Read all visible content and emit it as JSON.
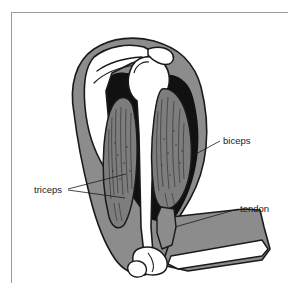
{
  "figure": {
    "kind": "anatomical-diagram",
    "frame_border_color": "#9a9a9a",
    "background_color": "#ffffff"
  },
  "palette": {
    "outline": "#1a1a1a",
    "skin_gray": "#8c8c8c",
    "fascia_black": "#111111",
    "muscle_gray": "#7d7d7d",
    "bone_white": "#ffffff",
    "striation": "#2a2a2a",
    "label_text": "#1a1a1a"
  },
  "labels": [
    {
      "id": "biceps",
      "text": "biceps",
      "text_x": 211,
      "text_y": 131,
      "anchor": "start",
      "leaders": [
        {
          "x1": 208,
          "y1": 128,
          "x2": 180,
          "y2": 143
        }
      ]
    },
    {
      "id": "triceps",
      "text": "triceps",
      "text_x": 22,
      "text_y": 180,
      "anchor": "start",
      "leaders": [
        {
          "x1": 56,
          "y1": 176,
          "x2": 114,
          "y2": 161
        },
        {
          "x1": 56,
          "y1": 177,
          "x2": 113,
          "y2": 185
        }
      ]
    },
    {
      "id": "tendon",
      "text": "tendon",
      "text_x": 228,
      "text_y": 199,
      "anchor": "start",
      "leaders": [
        {
          "x1": 226,
          "y1": 196,
          "x2": 163,
          "y2": 214
        }
      ]
    }
  ],
  "parts": [
    {
      "id": "skin-outline",
      "name": "arm skin and subcutaneous layer",
      "fill": "#8c8c8c"
    },
    {
      "id": "scapula",
      "name": "scapula",
      "fill": "#ffffff"
    },
    {
      "id": "humerus",
      "name": "humerus",
      "fill": "#ffffff"
    },
    {
      "id": "biceps-belly",
      "name": "biceps muscle belly",
      "fill": "#7d7d7d"
    },
    {
      "id": "triceps-belly",
      "name": "triceps muscle belly",
      "fill": "#7d7d7d"
    },
    {
      "id": "biceps-tendon",
      "name": "biceps tendon",
      "fill": "#8c8c8c"
    },
    {
      "id": "forearm",
      "name": "forearm",
      "fill": "#8c8c8c"
    },
    {
      "id": "forearm-bone",
      "name": "radius and ulna",
      "fill": "#ffffff"
    },
    {
      "id": "elbow-joint",
      "name": "elbow joint",
      "fill": "#ffffff"
    }
  ]
}
